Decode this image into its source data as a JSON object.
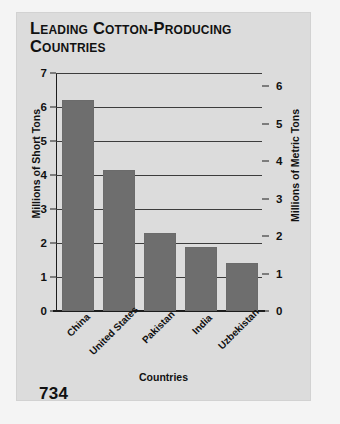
{
  "page": {
    "page_number": "734"
  },
  "chart_data": {
    "type": "bar",
    "title": "Leading Cotton-Producing Countries",
    "categories": [
      "China",
      "United States",
      "Pakistan",
      "India",
      "Uzbekistan"
    ],
    "values": [
      6.2,
      4.15,
      2.28,
      1.88,
      1.4
    ],
    "series": [
      {
        "name": "Millions of Short Tons",
        "values": [
          6.2,
          4.15,
          2.28,
          1.88,
          1.4
        ]
      }
    ],
    "xlabel": "Countries",
    "ylabel": "Millions of Short Tons",
    "ylabel_right": "Millions of Metric Tons",
    "ylim": [
      0,
      7
    ],
    "ylim_right": [
      0,
      6.35
    ],
    "yticks": [
      "0",
      "1",
      "2",
      "3",
      "4",
      "5",
      "6",
      "7"
    ],
    "yticks_right": [
      "0",
      "1",
      "2",
      "3",
      "4",
      "5",
      "6"
    ],
    "grid": true,
    "legend": "none",
    "bar_color": "#6e6e6e",
    "panel_color": "#dcdcdc",
    "axis_color": "#1d1d1d"
  }
}
